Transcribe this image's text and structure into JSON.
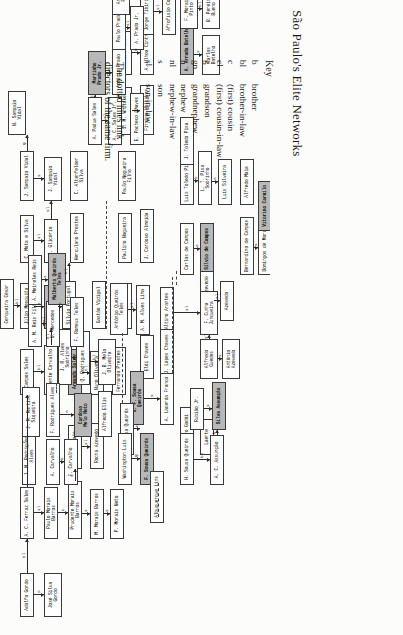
{
  "title": "São Paulo's Elite Networks",
  "key": {
    "heading": "Key",
    "entries": [
      {
        "abbr": "b",
        "def": "brother"
      },
      {
        "abbr": "bl",
        "def": "brother-in-law"
      },
      {
        "abbr": "c",
        "def": "(first) cousin"
      },
      {
        "abbr": "cl",
        "def": "(first) cousin-in-law"
      },
      {
        "abbr": "g",
        "def": "grandson"
      },
      {
        "abbr": "gn",
        "def": "grandnephew"
      },
      {
        "abbr": "n",
        "def": "nephew"
      },
      {
        "abbr": "nl",
        "def": "nephew-in-law"
      },
      {
        "abbr": "s",
        "def": "son"
      },
      {
        "abbr": "sl",
        "def": "son-in-law"
      }
    ],
    "note": "The dotted lines link directors of the same firm."
  },
  "chart_data": {
    "type": "diagram",
    "title": "São Paulo's Elite Networks",
    "legend_position": "right",
    "nodes": [
      {
        "id": "n1",
        "label": "Adolfo Gordo",
        "x": 18,
        "y": 20,
        "w": 44,
        "h": 14
      },
      {
        "id": "n2",
        "label": "José Silva\nGordo",
        "x": 18,
        "y": 44,
        "w": 44,
        "h": 18
      },
      {
        "id": "n3",
        "label": "A. C. Ferraz Sales",
        "x": 96,
        "y": 20,
        "w": 52,
        "h": 14
      },
      {
        "id": "n4",
        "label": "Paulo Morais Barros",
        "x": 96,
        "y": 44,
        "w": 52,
        "h": 14
      },
      {
        "id": "n5",
        "label": "Prudente Morais Barros",
        "x": 96,
        "y": 68,
        "w": 58,
        "h": 14
      },
      {
        "id": "n6",
        "label": "M. Morais Barros",
        "x": 96,
        "y": 90,
        "w": 50,
        "h": 14
      },
      {
        "id": "n7",
        "label": "P. Morais Neto",
        "x": 96,
        "y": 110,
        "w": 50,
        "h": 14
      },
      {
        "id": "n8",
        "label": "João Sampaio",
        "x": 166,
        "y": 68,
        "w": 44,
        "h": 14
      },
      {
        "id": "n9",
        "label": "Rocha Azevedo",
        "x": 166,
        "y": 90,
        "w": 46,
        "h": 14
      },
      {
        "id": "n10",
        "label": "Campos Sales",
        "x": 240,
        "y": 20,
        "w": 46,
        "h": 14
      },
      {
        "id": "n11",
        "label": "Vicente Carvalho",
        "x": 240,
        "y": 44,
        "w": 50,
        "h": 14
      },
      {
        "id": "n12",
        "label": "Armando Sales",
        "x": 240,
        "y": 68,
        "w": 46,
        "h": 14
      },
      {
        "id": "n13",
        "label": "Nuno Oliveira",
        "x": 240,
        "y": 90,
        "w": 44,
        "h": 14
      },
      {
        "id": "n14",
        "label": "Fernando Prestes",
        "x": 240,
        "y": 112,
        "w": 48,
        "h": 14
      },
      {
        "id": "n15",
        "label": "Júlio Mesquita",
        "x": 306,
        "y": 20,
        "w": 46,
        "h": 14
      },
      {
        "id": "n16",
        "label": "Cerqueira César",
        "x": 306,
        "y": 0,
        "w": 50,
        "h": 14
      },
      {
        "id": "n17",
        "label": "F. Mesquita",
        "x": 306,
        "y": 44,
        "w": 44,
        "h": 14
      },
      {
        "id": "n18",
        "label": "Sílvio Portugal",
        "x": 306,
        "y": 62,
        "w": 48,
        "h": 14
      },
      {
        "id": "n19",
        "label": "C. Mota e Silva",
        "x": 372,
        "y": 20,
        "w": 48,
        "h": 14
      },
      {
        "id": "n20",
        "label": "F. Glicério",
        "x": 372,
        "y": 44,
        "w": 44,
        "h": 14
      },
      {
        "id": "n21",
        "label": "J. Sampaio Vidal",
        "x": 434,
        "y": 20,
        "w": 50,
        "h": 14
      },
      {
        "id": "n22",
        "label": "N. Sampaio\nVidal",
        "x": 500,
        "y": 8,
        "w": 44,
        "h": 18
      },
      {
        "id": "n23",
        "label": "J. Sampaio\nVidal",
        "x": 434,
        "y": 44,
        "w": 44,
        "h": 18
      },
      {
        "id": "n24",
        "label": "Herculano Prestes",
        "x": 372,
        "y": 70,
        "w": 50,
        "h": 14
      },
      {
        "id": "n25",
        "label": "C. Altenfelder\nSilva",
        "x": 434,
        "y": 70,
        "w": 50,
        "h": 18
      },
      {
        "id": "n26",
        "label": "Gastão Vidigal",
        "x": 306,
        "y": 92,
        "w": 48,
        "h": 14
      },
      {
        "id": "n27",
        "label": "Júlio Prestes",
        "x": 306,
        "y": 118,
        "w": 46,
        "h": 14
      },
      {
        "id": "n28",
        "label": "Paulino Nogueira",
        "x": 372,
        "y": 118,
        "w": 50,
        "h": 14
      },
      {
        "id": "n29",
        "label": "Paulo Nogueira\nFilho",
        "x": 434,
        "y": 118,
        "w": 50,
        "h": 18
      },
      {
        "id": "n30",
        "label": "J. Cardoso Almeida",
        "x": 372,
        "y": 140,
        "w": 54,
        "h": 14
      },
      {
        "id": "n31",
        "label": "J. M. Whitaker",
        "x": 500,
        "y": 118,
        "w": 48,
        "h": 14
      },
      {
        "id": "n32",
        "label": "Firmino Whitaker",
        "x": 500,
        "y": 140,
        "w": 50,
        "h": 14
      },
      {
        "id": "n33",
        "label": "Fábio Prado",
        "x": 560,
        "y": 118,
        "w": 44,
        "h": 14
      },
      {
        "id": "n34",
        "label": "A. Ulhoa Cintra",
        "x": 560,
        "y": 140,
        "w": 48,
        "h": 14
      },
      {
        "id": "n35",
        "label": "Jorge Tibiriçá",
        "x": 600,
        "y": 140,
        "w": 46,
        "h": 14
      },
      {
        "id": "n36",
        "label": "Afrofísio Coelho",
        "x": 600,
        "y": 162,
        "w": 50,
        "h": 14
      },
      {
        "id": "n37",
        "label": "A. Padua Sales",
        "x": 490,
        "y": 88,
        "w": 48,
        "h": 14
      },
      {
        "id": "n38",
        "label": "A. C. Sales Jr.",
        "x": 490,
        "y": 108,
        "w": 48,
        "h": 14
      },
      {
        "id": "n39",
        "label": "Martinho\nPrado Jr.",
        "x": 540,
        "y": 88,
        "w": 44,
        "h": 18
      },
      {
        "id": "n40",
        "label": "Antônio Prado",
        "x": 540,
        "y": 112,
        "w": 48,
        "h": 14
      },
      {
        "id": "n41",
        "label": "Paulo Prado",
        "x": 585,
        "y": 112,
        "w": 44,
        "h": 14
      },
      {
        "id": "n42",
        "label": "A. Prado Jr.",
        "x": 585,
        "y": 130,
        "w": 44,
        "h": 14
      },
      {
        "id": "n43",
        "label": "Armando\nPrado",
        "x": 620,
        "y": 112,
        "w": 40,
        "h": 18
      },
      {
        "id": "n44",
        "label": "E. Pacheco Chaves",
        "x": 490,
        "y": 130,
        "w": 52,
        "h": 14
      },
      {
        "id": "n45",
        "label": "A. Arruda Botelho",
        "x": 560,
        "y": 180,
        "w": 52,
        "h": 14
      },
      {
        "id": "n46",
        "label": "Carlos\nBotelho",
        "x": 560,
        "y": 202,
        "w": 40,
        "h": 18
      },
      {
        "id": "n47",
        "label": "F. Morais\nPinto",
        "x": 606,
        "y": 180,
        "w": 40,
        "h": 18
      },
      {
        "id": "n48",
        "label": "B. Pereira\nBueno",
        "x": 606,
        "y": 202,
        "w": 40,
        "h": 18
      },
      {
        "id": "n49",
        "label": "Luís Toledo Pisa",
        "x": 430,
        "y": 180,
        "w": 48,
        "h": 14
      },
      {
        "id": "n50",
        "label": "J. Toledo Pisa",
        "x": 470,
        "y": 180,
        "w": 48,
        "h": 14
      },
      {
        "id": "n51",
        "label": "L. T. Pisa Sobrinho",
        "x": 430,
        "y": 198,
        "w": 54,
        "h": 14
      },
      {
        "id": "n52",
        "label": "Luís Silveira",
        "x": 430,
        "y": 218,
        "w": 46,
        "h": 14
      },
      {
        "id": "n53",
        "label": "Alfredo Maia",
        "x": 430,
        "y": 240,
        "w": 46,
        "h": 14
      },
      {
        "id": "n54",
        "label": "Carlos de Campos",
        "x": 360,
        "y": 180,
        "w": 52,
        "h": 14
      },
      {
        "id": "n55",
        "label": "Sílvio de Campos",
        "x": 360,
        "y": 200,
        "w": 52,
        "h": 14
      },
      {
        "id": "n56",
        "label": "Bernardino de Campos",
        "x": 360,
        "y": 240,
        "w": 58,
        "h": 14
      },
      {
        "id": "n57",
        "label": "Domingos de Morais",
        "x": 360,
        "y": 258,
        "w": 54,
        "h": 14
      },
      {
        "id": "n58",
        "label": "Vitorino Carmilo",
        "x": 404,
        "y": 258,
        "w": 50,
        "h": 14
      },
      {
        "id": "n59",
        "label": "Vicente Azevedo",
        "x": 314,
        "y": 200,
        "w": 50,
        "h": 14
      },
      {
        "id": "n60",
        "label": "Azevedo",
        "x": 314,
        "y": 220,
        "w": 40,
        "h": 14
      },
      {
        "id": "n61",
        "label": "Altino Arantes",
        "x": 300,
        "y": 160,
        "w": 48,
        "h": 14
      },
      {
        "id": "n62",
        "label": "F. Cunha\nJunqueira",
        "x": 300,
        "y": 200,
        "w": 44,
        "h": 18
      },
      {
        "id": "n63",
        "label": "Alfredo\nGuedes",
        "x": 256,
        "y": 200,
        "w": 40,
        "h": 18
      },
      {
        "id": "n64",
        "label": "Antônio\nAzevedo",
        "x": 256,
        "y": 222,
        "w": 40,
        "h": 18
      },
      {
        "id": "n65",
        "label": "J. Lopes Chaves",
        "x": 256,
        "y": 160,
        "w": 50,
        "h": 14
      },
      {
        "id": "n66",
        "label": "Elói Chaves",
        "x": 256,
        "y": 140,
        "w": 44,
        "h": 14
      },
      {
        "id": "n67",
        "label": "A. Lacerda Franco",
        "x": 210,
        "y": 160,
        "w": 52,
        "h": 14
      },
      {
        "id": "n68",
        "label": "G. F. Sousa Queirós",
        "x": 210,
        "y": 130,
        "w": 54,
        "h": 14
      },
      {
        "id": "n69",
        "label": "Gustavo Godói",
        "x": 180,
        "y": 180,
        "w": 48,
        "h": 14
      },
      {
        "id": "n70",
        "label": "Laerte",
        "x": 180,
        "y": 200,
        "w": 36,
        "h": 14
      },
      {
        "id": "n71",
        "label": "P. Sousa Queirós",
        "x": 180,
        "y": 120,
        "w": 52,
        "h": 14
      },
      {
        "id": "n72",
        "label": "F. Sousa Queirós",
        "x": 150,
        "y": 140,
        "w": 52,
        "h": 14
      },
      {
        "id": "n73",
        "label": "Washington Luís",
        "x": 150,
        "y": 118,
        "w": 52,
        "h": 14
      },
      {
        "id": "n74",
        "label": "Albuquerque Lins",
        "x": 112,
        "y": 150,
        "w": 52,
        "h": 14
      },
      {
        "id": "n75",
        "label": "H. Sousa Queirós",
        "x": 150,
        "y": 180,
        "w": 52,
        "h": 14
      },
      {
        "id": "n76",
        "label": "A. C. Assunção",
        "x": 150,
        "y": 210,
        "w": 50,
        "h": 14
      },
      {
        "id": "n77",
        "label": "Rubião Jr.",
        "x": 205,
        "y": 190,
        "w": 42,
        "h": 14
      },
      {
        "id": "n78",
        "label": "Silva Assunção",
        "x": 205,
        "y": 212,
        "w": 48,
        "h": 14
      },
      {
        "id": "n79",
        "label": "J. B. Melo\nOliveira",
        "x": 250,
        "y": 98,
        "w": 46,
        "h": 18
      },
      {
        "id": "n80",
        "label": "Q. Rodrigues Alves",
        "x": 250,
        "y": 76,
        "w": 54,
        "h": 14
      },
      {
        "id": "n81",
        "label": "J. R. Alves Sobrinho",
        "x": 250,
        "y": 58,
        "w": 56,
        "h": 14
      },
      {
        "id": "n82",
        "label": "Alfredo Ellis",
        "x": 198,
        "y": 98,
        "w": 46,
        "h": 14
      },
      {
        "id": "n83",
        "label": "Cardoso\nMelo Neto",
        "x": 198,
        "y": 74,
        "w": 44,
        "h": 18
      },
      {
        "id": "n84",
        "label": "F. Rodrigues Alves",
        "x": 198,
        "y": 46,
        "w": 54,
        "h": 14
      },
      {
        "id": "n85",
        "label": "J. M. Rodrigues Alves",
        "x": 150,
        "y": 22,
        "w": 58,
        "h": 14
      },
      {
        "id": "n86",
        "label": "J. M. Martins\nSiqueira",
        "x": 198,
        "y": 22,
        "w": 50,
        "h": 18
      },
      {
        "id": "n87",
        "label": "A. Carvalho",
        "x": 150,
        "y": 46,
        "w": 46,
        "h": 14
      },
      {
        "id": "n88",
        "label": "F. Carvalho",
        "x": 150,
        "y": 64,
        "w": 46,
        "h": 14
      },
      {
        "id": "n89",
        "label": "U. Mercedes",
        "x": 288,
        "y": 46,
        "w": 46,
        "h": 14
      },
      {
        "id": "n90",
        "label": "A. M. Reis Filho",
        "x": 288,
        "y": 28,
        "w": 50,
        "h": 14
      },
      {
        "id": "n91",
        "label": "A. Meireles Reis",
        "x": 330,
        "y": 28,
        "w": 50,
        "h": 14
      },
      {
        "id": "n92",
        "label": "Malberto Queirós\nTeles",
        "x": 330,
        "y": 48,
        "w": 52,
        "h": 18
      },
      {
        "id": "n93",
        "label": "F. Romeus Teles",
        "x": 288,
        "y": 70,
        "w": 50,
        "h": 14
      },
      {
        "id": "n94",
        "label": "Antônio Queirós\nTeles",
        "x": 300,
        "y": 110,
        "w": 52,
        "h": 18
      },
      {
        "id": "n95",
        "label": "A. M. Alves Lima",
        "x": 300,
        "y": 136,
        "w": 50,
        "h": 14
      }
    ],
    "edge_labels": [
      "b",
      "bl",
      "c",
      "cl",
      "g",
      "gn",
      "n",
      "nl",
      "s",
      "sl",
      "b or n"
    ]
  }
}
